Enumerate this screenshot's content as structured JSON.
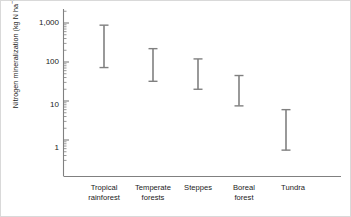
{
  "chart_data": {
    "type": "bar",
    "title": "",
    "xlabel": "",
    "ylabel": "Nitrogen mineralization (kg N ha⁻¹ a⁻¹)",
    "ylabel_parts": {
      "prefix": "Nitrogen mineralization (kg N ha",
      "sup1": "−1",
      "mid": " a",
      "sup2": "−1",
      "suffix": ")"
    },
    "scale": "log",
    "ylim": [
      0.3,
      2000
    ],
    "grid": false,
    "legend": "none",
    "yticks": [
      1,
      10,
      100,
      1000
    ],
    "ytick_labels": [
      "1",
      "10",
      "100",
      "1,000"
    ],
    "minor_ticks": true,
    "categories": [
      "Tropical rainforest",
      "Temperate forests",
      "Steppes",
      "Boreal forest",
      "Tundra"
    ],
    "category_lines": [
      [
        "Tropical",
        "rainforest"
      ],
      [
        "Temperate",
        "forests"
      ],
      [
        "Steppes"
      ],
      [
        "Boreal",
        "forest"
      ],
      [
        "Tundra"
      ]
    ],
    "series": [
      {
        "name": "Nitrogen mineralization range",
        "low": [
          72,
          32,
          20,
          7.5,
          0.55
        ],
        "high": [
          880,
          220,
          120,
          45,
          6.0
        ]
      }
    ],
    "marker_style": "range-bar-with-caps",
    "colors": {
      "bar": "#808080",
      "axis": "#808080",
      "text": "#1a1a1a",
      "background": "#ffffff",
      "border": "#d9d9d9"
    }
  }
}
